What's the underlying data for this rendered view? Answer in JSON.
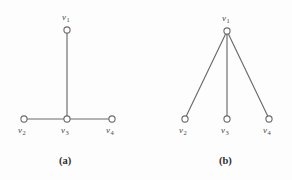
{
  "figure": {
    "background_color": "#fdfdfd",
    "edge_color": "#6a6a6a",
    "node_stroke_color": "#6a6a6a",
    "node_fill_color": "#ffffff",
    "label_color": "#4a4a4a",
    "caption_color": "#2e2e2e"
  },
  "panels": [
    {
      "id": "panel-a",
      "caption": "(a)",
      "caption_x": 59,
      "caption_y": 156,
      "nodes": [
        {
          "id": "v1",
          "label": "v",
          "sub": "1",
          "cx": 67,
          "cy": 30,
          "r": 3.1,
          "label_x": 62,
          "label_y": 13
        },
        {
          "id": "v2",
          "label": "v",
          "sub": "2",
          "cx": 24,
          "cy": 119,
          "r": 3.1,
          "label_x": 18,
          "label_y": 126
        },
        {
          "id": "v3",
          "label": "v",
          "sub": "3",
          "cx": 67,
          "cy": 119,
          "r": 3.1,
          "label_x": 61,
          "label_y": 126
        },
        {
          "id": "v4",
          "label": "v",
          "sub": "4",
          "cx": 112,
          "cy": 119,
          "r": 3.1,
          "label_x": 106,
          "label_y": 126
        }
      ],
      "edges": [
        {
          "id": "edge-v1-v3",
          "from": "v1",
          "to": "v3",
          "x1": 67,
          "y1": 33.1,
          "x2": 67,
          "y2": 115.9
        },
        {
          "id": "edge-v2-v3",
          "from": "v2",
          "to": "v3",
          "x1": 27.1,
          "y1": 119,
          "x2": 63.9,
          "y2": 119
        },
        {
          "id": "edge-v3-v4",
          "from": "v3",
          "to": "v4",
          "x1": 70.1,
          "y1": 119,
          "x2": 108.9,
          "y2": 119
        }
      ]
    },
    {
      "id": "panel-b",
      "caption": "(b)",
      "caption_x": 219,
      "caption_y": 156,
      "nodes": [
        {
          "id": "v1",
          "label": "v",
          "sub": "1",
          "cx": 227,
          "cy": 31,
          "r": 3.1,
          "label_x": 222,
          "label_y": 14
        },
        {
          "id": "v2",
          "label": "v",
          "sub": "2",
          "cx": 185,
          "cy": 119,
          "r": 3.1,
          "label_x": 179,
          "label_y": 126
        },
        {
          "id": "v3",
          "label": "v",
          "sub": "3",
          "cx": 227,
          "cy": 119,
          "r": 3.1,
          "label_x": 221,
          "label_y": 126
        },
        {
          "id": "v4",
          "label": "v",
          "sub": "4",
          "cx": 269,
          "cy": 119,
          "r": 3.1,
          "label_x": 263,
          "label_y": 126
        }
      ],
      "edges": [
        {
          "id": "edge-v1-v2",
          "from": "v1",
          "to": "v2",
          "x1": 225.6,
          "y1": 33.9,
          "x2": 186.3,
          "y2": 116.1
        },
        {
          "id": "edge-v1-v3",
          "from": "v1",
          "to": "v3",
          "x1": 227,
          "y1": 34.1,
          "x2": 227,
          "y2": 115.9
        },
        {
          "id": "edge-v1-v4",
          "from": "v1",
          "to": "v4",
          "x1": 228.4,
          "y1": 33.9,
          "x2": 267.7,
          "y2": 116.1
        }
      ]
    }
  ]
}
